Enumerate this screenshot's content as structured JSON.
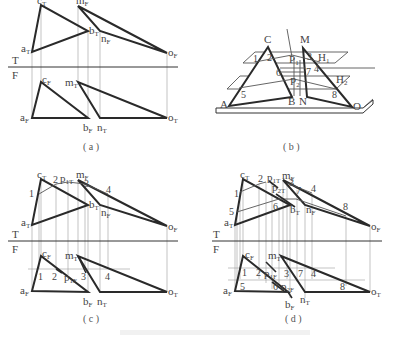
{
  "figure": {
    "panels": [
      {
        "id": "a",
        "caption": "( a )",
        "axis": {
          "upper": "T",
          "lower": "F"
        },
        "points_top": [
          "aT",
          "cT",
          "bT",
          "mF",
          "nF",
          "oF"
        ],
        "points_bottom": [
          "aF",
          "cF",
          "bF",
          "mT",
          "nT",
          "oT"
        ]
      },
      {
        "id": "b",
        "caption": "( b )",
        "labels": [
          "C",
          "M",
          "H1",
          "P1",
          "1",
          "2",
          "3",
          "4",
          "6",
          "7",
          "H2",
          "P2",
          "5",
          "8",
          "A",
          "B",
          "N",
          "O"
        ]
      },
      {
        "id": "c",
        "caption": "( c )",
        "axis": {
          "upper": "T",
          "lower": "F"
        },
        "numbers_top": [
          "1",
          "2",
          "3",
          "4"
        ],
        "numbers_bottom": [
          "1",
          "2",
          "3",
          "4"
        ],
        "extra_points": [
          "p1T",
          "p1F"
        ]
      },
      {
        "id": "d",
        "caption": "( d )",
        "axis": {
          "upper": "T",
          "lower": "F"
        },
        "numbers_top": [
          "1",
          "2",
          "3",
          "4",
          "5",
          "6",
          "7",
          "8"
        ],
        "numbers_bottom": [
          "1",
          "2",
          "3",
          "4",
          "5",
          "6",
          "7",
          "8"
        ],
        "extra_points": [
          "p1T",
          "p2T",
          "p1F",
          "p2F"
        ]
      }
    ],
    "labels": {
      "T": "T",
      "F": "F",
      "a": "a",
      "b": "b",
      "c": "c",
      "m": "m",
      "n": "n",
      "o": "o",
      "p": "p",
      "subT": "T",
      "subF": "F",
      "sub1T": "1T",
      "sub1F": "1F",
      "sub2T": "2T",
      "sub2F": "2F",
      "A": "A",
      "B": "B",
      "C": "C",
      "M": "M",
      "N": "N",
      "O": "O",
      "H": "H",
      "P": "P",
      "s1": "1",
      "s2": "2",
      "n1": "1",
      "n2": "2",
      "n3": "3",
      "n4": "4",
      "n5": "5",
      "n6": "6",
      "n7": "7",
      "n8": "8"
    },
    "captions": {
      "a": "( a )",
      "b": "( b )",
      "c": "( c )",
      "d": "( d )"
    }
  }
}
